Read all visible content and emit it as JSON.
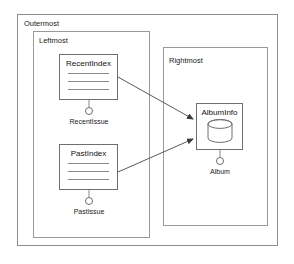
{
  "diagram": {
    "type": "uml-component-diagram",
    "containers": [
      {
        "id": "outermost",
        "label": "Outermost"
      },
      {
        "id": "leftmost",
        "label": "Leftmost"
      },
      {
        "id": "rightmost",
        "label": "Rightmost"
      }
    ],
    "components": [
      {
        "id": "recentindex",
        "label": "RecentIndex",
        "detail_rules": 3
      },
      {
        "id": "pastindex",
        "label": "PastIndex",
        "detail_rules": 3
      },
      {
        "id": "albuminfo",
        "label": "AlbumInfo",
        "icon": "database-cylinder-icon"
      }
    ],
    "interfaces": [
      {
        "id": "recentissue",
        "label": "RecentIssue",
        "provider": "recentindex"
      },
      {
        "id": "pastissue",
        "label": "PastIssue",
        "provider": "pastindex"
      },
      {
        "id": "album",
        "label": "Album",
        "provider": "albuminfo"
      }
    ],
    "connections": [
      {
        "from": "recentindex",
        "to": "albuminfo",
        "arrow": "solid-filled-arrowhead"
      },
      {
        "from": "pastindex",
        "to": "albuminfo",
        "arrow": "solid-filled-arrowhead"
      }
    ],
    "colors": {
      "background": "#ffffff",
      "frame_border": "#9a9a9a",
      "component_border": "#6f6f6f",
      "connector": "#5a5a5a",
      "text": "#1a1a1a"
    }
  }
}
